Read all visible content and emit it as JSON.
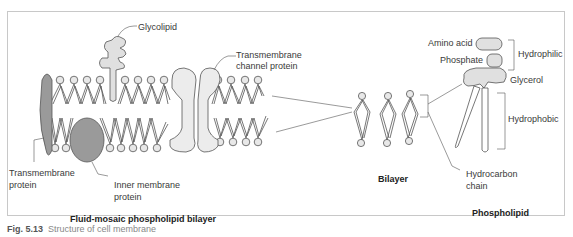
{
  "figure": {
    "caption_prefix": "Fig. 5.13",
    "caption_text": "Structure of cell membrane"
  },
  "panels": {
    "membrane": {
      "title": "Fluid-mosaic phospholipid bilayer",
      "labels": {
        "glycolipid": "Glycolipid",
        "channel_line1": "Transmembrane",
        "channel_line2": "channel protein",
        "transmembrane_line1": "Transmembrane",
        "transmembrane_line2": "protein",
        "inner_line1": "Inner membrane",
        "inner_line2": "protein"
      }
    },
    "bilayer": {
      "title": "Bilayer"
    },
    "phospholipid": {
      "title": "Phospholipid",
      "labels": {
        "amino_acid": "Amino acid",
        "phosphate": "Phosphate",
        "hydrophilic": "Hydrophilic",
        "glycerol": "Glycerol",
        "hydrophobic": "Hydrophobic",
        "hydrocarbon_line1": "Hydrocarbon",
        "hydrocarbon_line2": "chain"
      }
    }
  },
  "colors": {
    "protein_light": "#e6e6e6",
    "protein_dark": "#9a9a9a",
    "outline": "#555555",
    "frame": "#c8c8c8"
  }
}
